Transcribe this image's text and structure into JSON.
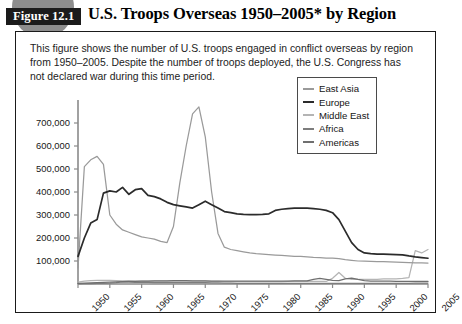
{
  "figure": {
    "badge_label": "Figure 12.1",
    "title": "U.S. Troops Overseas 1950–2005* by Region",
    "caption": "This figure shows the number of U.S. troops engaged in conflict overseas by region from 1950–2005. Despite the number of troops deployed, the U.S. Congress has not declared war during this time period."
  },
  "colors": {
    "east_asia": "#9a9a9a",
    "europe": "#2b2b2b",
    "middle_east": "#b4b4b4",
    "africa": "#7d7d7d",
    "americas": "#6f6f6f",
    "axis": "#8a8a8a",
    "frame": "#1a1a1a",
    "badge_bg": "#1b1b1b",
    "disc": "#8d8d8d"
  },
  "chart_data": {
    "type": "line",
    "title": "U.S. Troops Overseas 1950–2005* by Region",
    "xlabel": "",
    "ylabel": "",
    "xlim": [
      1950,
      2005
    ],
    "ylim": [
      0,
      800000
    ],
    "grid": false,
    "legend_position": "top-right",
    "x_ticks": [
      1950,
      1955,
      1960,
      1965,
      1970,
      1975,
      1980,
      1985,
      1990,
      1995,
      2000,
      2005
    ],
    "x_tick_labels": [
      "1950",
      "1955",
      "1960",
      "1965",
      "1970",
      "1975",
      "1980",
      "1985",
      "1990",
      "1995",
      "2000",
      "2005"
    ],
    "y_ticks": [
      100000,
      200000,
      300000,
      400000,
      500000,
      600000,
      700000
    ],
    "y_tick_labels": [
      "100,000",
      "200,000",
      "300,000",
      "400,000",
      "500,000",
      "600,000",
      "700,000"
    ],
    "x": [
      1950,
      1951,
      1952,
      1953,
      1954,
      1955,
      1956,
      1957,
      1958,
      1959,
      1960,
      1961,
      1962,
      1963,
      1964,
      1965,
      1966,
      1967,
      1968,
      1969,
      1970,
      1971,
      1972,
      1973,
      1974,
      1975,
      1976,
      1977,
      1978,
      1979,
      1980,
      1981,
      1982,
      1983,
      1984,
      1985,
      1986,
      1987,
      1988,
      1989,
      1990,
      1991,
      1992,
      1993,
      1994,
      1995,
      1996,
      1997,
      1998,
      1999,
      2000,
      2001,
      2002,
      2003,
      2004,
      2005
    ],
    "series": [
      {
        "name": "East Asia",
        "color": "#9a9a9a",
        "values": [
          70000,
          510000,
          540000,
          555000,
          520000,
          300000,
          260000,
          235000,
          225000,
          215000,
          205000,
          200000,
          195000,
          185000,
          180000,
          250000,
          440000,
          600000,
          740000,
          770000,
          640000,
          400000,
          220000,
          160000,
          150000,
          145000,
          140000,
          135000,
          132000,
          130000,
          128000,
          126000,
          124000,
          122000,
          120000,
          120000,
          118000,
          116000,
          115000,
          113000,
          112000,
          110000,
          106000,
          103000,
          100000,
          99000,
          98000,
          97000,
          97000,
          96000,
          95000,
          94000,
          93000,
          92000,
          92000,
          91000
        ]
      },
      {
        "name": "Europe",
        "color": "#2b2b2b",
        "values": [
          120000,
          200000,
          265000,
          280000,
          395000,
          405000,
          400000,
          420000,
          390000,
          410000,
          415000,
          385000,
          380000,
          370000,
          355000,
          345000,
          340000,
          335000,
          330000,
          345000,
          360000,
          345000,
          330000,
          315000,
          310000,
          305000,
          303000,
          302000,
          302000,
          303000,
          305000,
          320000,
          325000,
          328000,
          330000,
          330000,
          330000,
          328000,
          325000,
          320000,
          310000,
          280000,
          230000,
          180000,
          150000,
          135000,
          132000,
          130000,
          130000,
          129000,
          128000,
          127000,
          122000,
          118000,
          115000,
          112000
        ]
      },
      {
        "name": "Middle East",
        "color": "#b4b4b4",
        "values": [
          8000,
          12000,
          15000,
          16000,
          16000,
          16000,
          15000,
          14000,
          14000,
          13000,
          13000,
          13000,
          12000,
          12000,
          12000,
          12000,
          12000,
          12000,
          12000,
          12000,
          12000,
          11000,
          11000,
          10000,
          10000,
          10000,
          10000,
          10000,
          10000,
          10000,
          10000,
          10000,
          10000,
          11000,
          11000,
          11000,
          11000,
          11000,
          11000,
          11000,
          25000,
          50000,
          25000,
          20000,
          20000,
          20000,
          20000,
          20000,
          22000,
          22000,
          22000,
          24000,
          28000,
          145000,
          135000,
          150000
        ]
      },
      {
        "name": "Africa",
        "color": "#7d7d7d",
        "values": [
          1000,
          1500,
          2000,
          2500,
          3000,
          4000,
          6000,
          9000,
          8000,
          7000,
          7000,
          7000,
          6000,
          6000,
          6000,
          6000,
          6000,
          6000,
          6000,
          6000,
          6000,
          5000,
          5000,
          4000,
          4000,
          3000,
          3000,
          3000,
          3000,
          3000,
          3000,
          3000,
          3000,
          3000,
          3000,
          3000,
          3000,
          3000,
          3000,
          3000,
          3000,
          3000,
          3000,
          3000,
          3000,
          3000,
          3000,
          3000,
          3000,
          3000,
          3000,
          3000,
          3000,
          4000,
          4000,
          4000
        ]
      },
      {
        "name": "Americas",
        "color": "#6f6f6f",
        "values": [
          3000,
          4000,
          5000,
          6000,
          7000,
          8000,
          9000,
          10000,
          11000,
          11000,
          12000,
          13000,
          14000,
          14000,
          14000,
          15000,
          15000,
          15000,
          14000,
          14000,
          14000,
          13000,
          13000,
          13000,
          13000,
          13000,
          13000,
          13000,
          13000,
          13000,
          13000,
          13000,
          13000,
          13000,
          14000,
          14000,
          14000,
          20000,
          24000,
          20000,
          16000,
          15000,
          22000,
          26000,
          20000,
          15000,
          13000,
          12000,
          12000,
          12000,
          11000,
          11000,
          11000,
          11000,
          11000,
          11000
        ]
      }
    ]
  },
  "legend": {
    "items": [
      {
        "label": "East Asia"
      },
      {
        "label": "Europe"
      },
      {
        "label": "Middle East"
      },
      {
        "label": "Africa"
      },
      {
        "label": "Americas"
      }
    ]
  }
}
